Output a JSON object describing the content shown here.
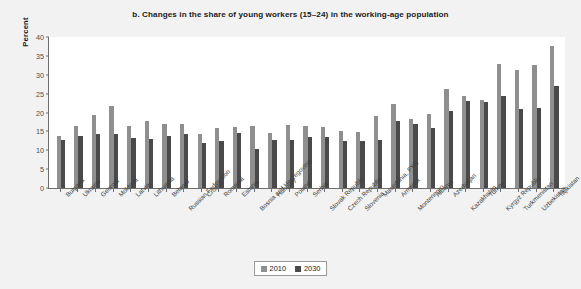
{
  "chart_data": {
    "type": "bar",
    "title": "b. Changes in the share of young workers (15–24) in the working-age population",
    "xlabel": "",
    "ylabel": "Percent",
    "ylim": [
      0,
      40
    ],
    "yticks": [
      0,
      5,
      10,
      15,
      20,
      25,
      30,
      35,
      40
    ],
    "grid": false,
    "legend_position": "bottom-center",
    "categories": [
      "Bulgaria",
      "Ukraine",
      "Georgia",
      "Moldova",
      "Latvia",
      "Lithuania",
      "Belarus",
      "Russian Federation",
      "Croatia",
      "Romania",
      "Estonia",
      "Bosnia and Herzegovina",
      "Hungary",
      "Poland",
      "Serbia",
      "Slovak Republic",
      "Czech Republic",
      "Slovenia",
      "Macedonia, FYR",
      "Armenia",
      "Montenegro",
      "Albania",
      "Azerbaijan",
      "Kazakhstan",
      "Turkey",
      "Kyrgyz Republic",
      "Turkmenistan",
      "Uzbekistan",
      "Tajikistan"
    ],
    "series": [
      {
        "name": "2010",
        "color": "#8f8f8f",
        "values": [
          13.8,
          16.3,
          19.3,
          21.8,
          16.5,
          17.8,
          17.0,
          16.9,
          14.3,
          15.9,
          16.2,
          16.3,
          14.6,
          16.8,
          16.5,
          16.2,
          15.2,
          14.9,
          19.0,
          22.3,
          18.3,
          19.5,
          26.2,
          24.5,
          23.3,
          32.8,
          31.3,
          32.6,
          37.5
        ]
      },
      {
        "name": "2030",
        "color": "#4a4a4a",
        "values": [
          12.8,
          13.8,
          14.2,
          14.3,
          13.2,
          12.9,
          13.7,
          14.3,
          12.0,
          12.4,
          14.6,
          10.3,
          12.7,
          12.6,
          13.6,
          13.6,
          12.4,
          12.5,
          12.6,
          17.8,
          16.9,
          15.8,
          20.3,
          23.0,
          22.8,
          24.3,
          21.0,
          21.3,
          27.0
        ]
      }
    ]
  },
  "legend": {
    "items": [
      {
        "label": "2010"
      },
      {
        "label": "2030"
      }
    ]
  }
}
